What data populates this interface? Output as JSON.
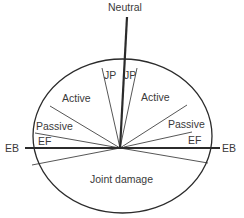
{
  "diagram": {
    "labels": {
      "neutral": "Neutral",
      "jp_left": "JP",
      "jp_right": "JP",
      "active_left": "Active",
      "active_right": "Active",
      "passive_left": "Passive",
      "passive_right": "Passive",
      "ef_left": "EF",
      "ef_right": "EF",
      "eb_left": "EB",
      "eb_right": "EB",
      "joint_damage": "Joint damage"
    },
    "colors": {
      "stroke": "#2b2b2b",
      "text": "#3a3a3a",
      "background": "#ffffff"
    }
  }
}
